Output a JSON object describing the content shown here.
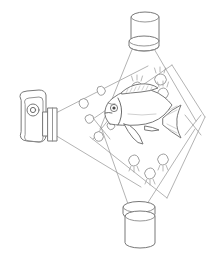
{
  "figure": {
    "background_color": "#ffffff",
    "line_color": "#8a8a8a",
    "accent_color": "#6b6b6b",
    "width": 210,
    "height": 258
  },
  "camera": {
    "label": "camera",
    "body_label": "camera-body",
    "lens_label": "camera-lens",
    "dial_label": "camera-dial",
    "cone_label": "camera-field-of-view",
    "position": {
      "x": 18,
      "y": 98
    }
  },
  "light_sources": [
    {
      "label": "top-light-source",
      "beam_label": "top-light-beam",
      "position": {
        "x": 130,
        "y": 8
      },
      "orientation": "downward"
    },
    {
      "label": "bottom-light-source",
      "beam_label": "bottom-light-beam",
      "position": {
        "x": 122,
        "y": 202
      },
      "orientation": "upward"
    }
  ],
  "subject": {
    "label": "fish",
    "position": {
      "x": 105,
      "y": 98
    },
    "parts": [
      "body",
      "head",
      "eye",
      "dorsal-fin",
      "pectoral-fin",
      "pelvic-fin",
      "tail-fin",
      "gill-line"
    ]
  },
  "particles": {
    "illuminated_label": "illuminated-particle",
    "plain_label": "suspended-particle",
    "illuminated": [
      {
        "x": 137,
        "y": 87,
        "r": 4.2,
        "ticks": "up"
      },
      {
        "x": 160,
        "y": 79,
        "r": 4.6,
        "ticks": "up"
      },
      {
        "x": 163,
        "y": 93,
        "r": 4.2,
        "ticks": "up"
      },
      {
        "x": 134,
        "y": 161,
        "r": 4.4,
        "ticks": "down"
      },
      {
        "x": 163,
        "y": 160,
        "r": 4.4,
        "ticks": "down"
      },
      {
        "x": 150,
        "y": 174,
        "r": 4.4,
        "ticks": "down"
      }
    ],
    "plain": [
      {
        "x": 101,
        "y": 90,
        "r": 3.4
      },
      {
        "x": 83,
        "y": 103,
        "r": 3.6
      },
      {
        "x": 89,
        "y": 119,
        "r": 3.4
      },
      {
        "x": 98,
        "y": 136,
        "r": 3.6
      },
      {
        "x": 111,
        "y": 126,
        "r": 3.2
      }
    ]
  },
  "crossings": [
    {
      "label": "beam-crossing-left",
      "x": 101,
      "y": 128
    },
    {
      "label": "beam-crossing-right",
      "x": 192,
      "y": 125
    }
  ]
}
